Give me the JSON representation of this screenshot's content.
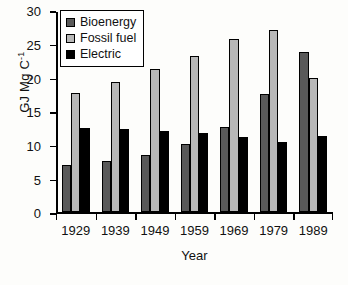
{
  "chart_data": {
    "type": "bar",
    "title": "",
    "xlabel": "Year",
    "ylabel": "GJ Mg C",
    "ylabel_sup": "-1",
    "ylabel_full": "GJ Mg C-1",
    "categories": [
      "1929",
      "1939",
      "1949",
      "1959",
      "1969",
      "1979",
      "1989"
    ],
    "series": [
      {
        "name": "Bioenergy",
        "color": "#595959",
        "values": [
          7.0,
          7.6,
          8.5,
          10.2,
          12.7,
          17.6,
          23.8
        ]
      },
      {
        "name": "Fossil fuel",
        "color": "#b8b8b8",
        "values": [
          17.8,
          19.4,
          21.3,
          23.3,
          25.7,
          27.1,
          19.9
        ]
      },
      {
        "name": "Electric",
        "color": "#000000",
        "values": [
          12.6,
          12.4,
          12.1,
          11.8,
          11.2,
          10.4,
          11.3
        ]
      }
    ],
    "ylim": [
      0,
      30
    ],
    "yticks": [
      0,
      5,
      10,
      15,
      20,
      25,
      30
    ],
    "ytick_labels": [
      "0",
      "5",
      "10",
      "15",
      "20",
      "25",
      "30"
    ],
    "grid": false,
    "legend_position": "upper-left"
  },
  "legend": {
    "items": [
      {
        "label": "Bioenergy",
        "color": "#595959"
      },
      {
        "label": "Fossil fuel",
        "color": "#b8b8b8"
      },
      {
        "label": "Electric",
        "color": "#000000"
      }
    ]
  }
}
